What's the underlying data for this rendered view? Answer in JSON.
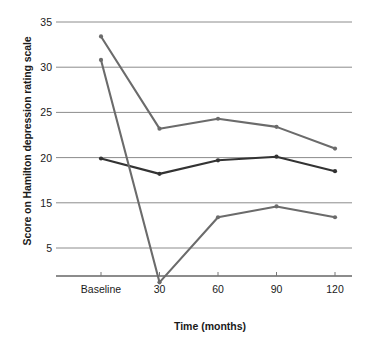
{
  "chart_data": {
    "type": "line",
    "title": "",
    "xlabel": "Time (months)",
    "ylabel": "Score on Hamilton depression rating scale",
    "categories": [
      "Baseline",
      "30",
      "60",
      "90",
      "120"
    ],
    "y_tick_labels": [
      "35",
      "30",
      "25",
      "20",
      "15",
      "5"
    ],
    "y_tick_values": [
      35,
      30,
      25,
      20,
      15,
      10
    ],
    "ylim": [
      5,
      35
    ],
    "grid": true,
    "legend": "none",
    "series": [
      {
        "name": "upper-series",
        "color": "#6b6b6b",
        "values": [
          33.4,
          23.2,
          24.3,
          23.4,
          21.0
        ]
      },
      {
        "name": "middle-series",
        "color": "#333333",
        "values": [
          19.9,
          18.2,
          19.7,
          20.1,
          18.5
        ]
      },
      {
        "name": "lower-series",
        "color": "#6b6b6b",
        "values": [
          30.8,
          6.2,
          13.4,
          14.6,
          13.4
        ]
      }
    ]
  },
  "axis": {
    "gridline_color": "#8c8c8c",
    "axis_line_color": "#1a1a1a"
  }
}
